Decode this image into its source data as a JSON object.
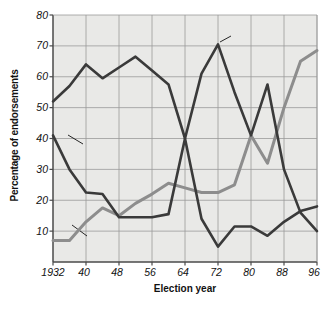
{
  "chart_data": {
    "type": "line",
    "title": "",
    "xlabel": "Election year",
    "ylabel": "Percentage of endorsements",
    "xlim": [
      1932,
      1996
    ],
    "ylim": [
      0,
      80
    ],
    "xticks": [
      "1932",
      "40",
      "48",
      "56",
      "64",
      "72",
      "80",
      "88",
      "96"
    ],
    "xtick_values": [
      1932,
      1940,
      1948,
      1956,
      1964,
      1972,
      1980,
      1988,
      1996
    ],
    "yticks": [
      "10",
      "20",
      "30",
      "40",
      "50",
      "60",
      "70",
      "80"
    ],
    "ytick_values": [
      10,
      20,
      30,
      40,
      50,
      60,
      70,
      80
    ],
    "grid": true,
    "legend_position": "inline-annotations",
    "x": [
      1932,
      1936,
      1940,
      1944,
      1948,
      1952,
      1956,
      1960,
      1964,
      1968,
      1972,
      1976,
      1980,
      1984,
      1988,
      1992,
      1996
    ],
    "series": [
      {
        "name": "Republican candidate",
        "color": "#3a3a3a",
        "values": [
          52,
          57,
          64,
          59.5,
          63,
          66.5,
          62,
          57.5,
          40,
          61,
          70.5,
          55,
          41,
          57.5,
          30,
          16,
          10
        ]
      },
      {
        "name": "Democratic candidate",
        "color": "#3a3a3a",
        "values": [
          41,
          30,
          22.5,
          22,
          14.5,
          14.5,
          14.5,
          15.5,
          40,
          14,
          5,
          11.5,
          11.5,
          8.5,
          13,
          16.5,
          18
        ]
      },
      {
        "name": "No endorsement",
        "color": "#8d8d8d",
        "values": [
          7,
          7,
          13,
          17.5,
          15,
          19,
          22,
          25.5,
          24,
          22.5,
          22.5,
          25,
          41,
          32,
          50,
          65,
          68.5
        ]
      }
    ],
    "annotations": [
      {
        "text_line1": "Republican",
        "text_line2": "candidate"
      },
      {
        "text_line1": "Democratic",
        "text_line2": "candidate"
      },
      {
        "text_line1": "No endorsement",
        "text_line2": ""
      }
    ],
    "colors": {
      "plot_background": "#e9e9e7",
      "grid": "#9a9a9a",
      "axis": "#4a4a4a",
      "dark_line": "#3a3a3a",
      "gray_line": "#8d8d8d",
      "text": "#111111"
    }
  }
}
